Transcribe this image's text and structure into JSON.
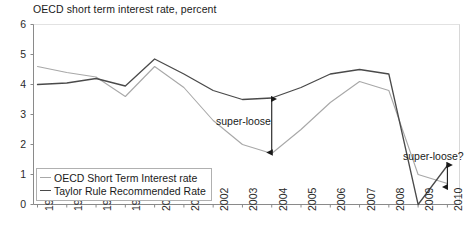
{
  "chart_data": {
    "type": "line",
    "title": "OECD short term interest rate, percent",
    "xlabel": "",
    "ylabel": "",
    "ylim": [
      0,
      6
    ],
    "yticks": [
      0,
      1,
      2,
      3,
      4,
      5,
      6
    ],
    "grid": false,
    "legend_position": "bottom-left",
    "categories": [
      "1996",
      "1997",
      "1998",
      "1999",
      "2000",
      "2001",
      "2002",
      "2003",
      "2004",
      "2005",
      "2006",
      "2007",
      "2008",
      "2009",
      "2010"
    ],
    "series": [
      {
        "name": "OECD Short Term Interest rate",
        "color": "#a8a8a8",
        "values": [
          4.6,
          4.4,
          4.25,
          3.6,
          4.6,
          3.9,
          2.8,
          2.0,
          1.7,
          2.5,
          3.4,
          4.1,
          3.8,
          1.0,
          0.7
        ]
      },
      {
        "name": "Taylor Rule Recommended Rate",
        "color": "#4a4a4a",
        "values": [
          4.0,
          4.05,
          4.2,
          3.95,
          4.85,
          4.35,
          3.8,
          3.5,
          3.55,
          3.9,
          4.35,
          4.5,
          4.35,
          0.0,
          1.3
        ]
      }
    ],
    "annotations": [
      {
        "id": "super-loose",
        "text": "super-loose",
        "marker": "double-headed-vertical-arrow",
        "x_category": "2004",
        "y_from": 3.55,
        "y_to": 1.7
      },
      {
        "id": "super-loose-q",
        "text": "super-loose?",
        "marker": "double-headed-vertical-arrow",
        "x_category": "2010",
        "y_from": 1.35,
        "y_to": 0.55
      }
    ]
  },
  "legend": {
    "items": [
      {
        "label": "OECD Short Term Interest rate",
        "color": "#a8a8a8"
      },
      {
        "label": "Taylor Rule Recommended Rate",
        "color": "#4a4a4a"
      }
    ]
  },
  "axes": {
    "y_labels": [
      "6",
      "5",
      "4",
      "3",
      "2",
      "1",
      "0"
    ],
    "x_labels": [
      "1996",
      "1997",
      "1998",
      "1999",
      "2000",
      "2001",
      "2002",
      "2003",
      "2004",
      "2005",
      "2006",
      "2007",
      "2008",
      "2009",
      "2010"
    ]
  }
}
